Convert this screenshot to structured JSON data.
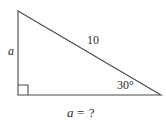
{
  "figure": {
    "stroke_color": "#4a4a4a",
    "text_color": "#2b2b2b",
    "background_color": "#ffffff"
  },
  "labels": {
    "vertical_side": "a",
    "hypotenuse": "10",
    "angle": "30°",
    "question_variable": "a",
    "question_operator": "=",
    "question_mark": "?"
  },
  "geometry": {
    "apex": "18,11",
    "right_angle_vertex": "18,95",
    "base_right_vertex": "161,95",
    "right_angle_marker": "18,85 28,85 28,95",
    "right_angle_marker_size": 10
  }
}
